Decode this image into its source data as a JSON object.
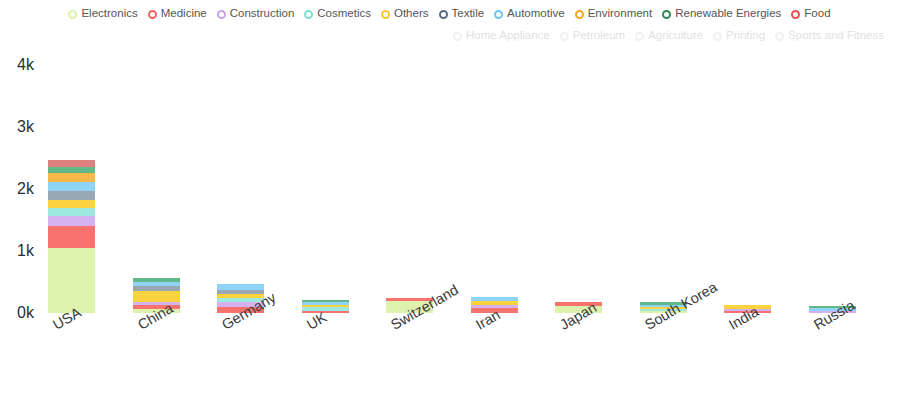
{
  "legend": {
    "rows": [
      [
        {
          "label": "Electronics",
          "color": "#d9f2a8",
          "active": true
        },
        {
          "label": "Medicine",
          "color": "#f4625f",
          "active": true
        },
        {
          "label": "Construction",
          "color": "#c9a5e8",
          "active": true
        },
        {
          "label": "Cosmetics",
          "color": "#7fe0d4",
          "active": true
        },
        {
          "label": "Others",
          "color": "#f7c92b",
          "active": true
        },
        {
          "label": "Textile",
          "color": "#5b6a7d",
          "active": true
        },
        {
          "label": "Automotive",
          "color": "#6ec6f5",
          "active": true
        },
        {
          "label": "Environment",
          "color": "#f6a623",
          "active": true
        },
        {
          "label": "Renewable Energies",
          "color": "#2e8b57",
          "active": true
        },
        {
          "label": "Food",
          "color": "#e8504f",
          "active": true
        }
      ],
      [
        {
          "label": "Home Appliance",
          "color": "#cfcfcf",
          "active": false
        },
        {
          "label": "Petroleum",
          "color": "#cfcfcf",
          "active": false
        },
        {
          "label": "Agriculture",
          "color": "#cfcfcf",
          "active": false
        },
        {
          "label": "Printing",
          "color": "#cfcfcf",
          "active": false
        },
        {
          "label": "Sports and Fitness",
          "color": "#cfcfcf",
          "active": false
        }
      ]
    ]
  },
  "chart_data": {
    "type": "bar",
    "stacked": true,
    "title": "",
    "xlabel": "",
    "ylabel": "",
    "ylim": [
      0,
      4000
    ],
    "ytick_labels": [
      "0k",
      "1k",
      "2k",
      "3k",
      "4k"
    ],
    "ytick_values": [
      0,
      1000,
      2000,
      3000,
      4000
    ],
    "grid": false,
    "legend_position": "top",
    "categories": [
      "USA",
      "China",
      "Germany",
      "UK",
      "Switzerland",
      "Iran",
      "Japan",
      "South Korea",
      "India",
      "Russia"
    ],
    "series": [
      {
        "name": "Electronics",
        "color": "#ddf2ac",
        "values": [
          1050,
          70,
          0,
          0,
          200,
          0,
          110,
          30,
          0,
          0
        ]
      },
      {
        "name": "Medicine",
        "color": "#f8726e",
        "values": [
          350,
          55,
          90,
          40,
          45,
          75,
          60,
          0,
          22,
          0
        ]
      },
      {
        "name": "Construction",
        "color": "#d4b2f0",
        "values": [
          170,
          60,
          85,
          0,
          0,
          60,
          0,
          0,
          18,
          40
        ]
      },
      {
        "name": "Cosmetics",
        "color": "#9fe8de",
        "values": [
          130,
          0,
          70,
          50,
          0,
          0,
          0,
          35,
          0,
          0
        ]
      },
      {
        "name": "Others",
        "color": "#fbd33f",
        "values": [
          130,
          175,
          70,
          40,
          0,
          65,
          0,
          30,
          72,
          0
        ]
      },
      {
        "name": "Textile",
        "color": "#9aa7b5",
        "values": [
          140,
          80,
          55,
          0,
          0,
          0,
          0,
          0,
          0,
          0
        ]
      },
      {
        "name": "Automotive",
        "color": "#8fd4f7",
        "values": [
          150,
          60,
          95,
          45,
          0,
          55,
          0,
          28,
          0,
          38
        ]
      },
      {
        "name": "Environment",
        "color": "#f9b94a",
        "values": [
          140,
          0,
          0,
          0,
          0,
          0,
          0,
          0,
          0,
          0
        ]
      },
      {
        "name": "Renewable Energies",
        "color": "#62b887",
        "values": [
          95,
          70,
          0,
          35,
          0,
          0,
          0,
          40,
          0,
          35
        ]
      },
      {
        "name": "Food",
        "color": "#df8080",
        "values": [
          120,
          0,
          0,
          0,
          0,
          0,
          0,
          0,
          0,
          0
        ]
      }
    ],
    "totals": [
      2475,
      570,
      465,
      210,
      245,
      255,
      170,
      163,
      112,
      113
    ]
  },
  "axis": {
    "y_max_value": 4000,
    "pixels_per_1k": 62
  }
}
